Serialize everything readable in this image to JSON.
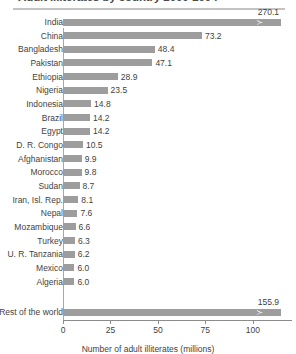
{
  "chart_data": {
    "type": "bar",
    "orientation": "horizontal",
    "title": "Adult illiterates by country 2000-2004",
    "xlabel": "Number of adult illiterates (millions)",
    "ylabel": "",
    "xlim": [
      0,
      115
    ],
    "xticks": [
      0,
      25,
      50,
      75,
      100
    ],
    "xtick_labels": [
      "0",
      "25",
      "50",
      "75",
      "100"
    ],
    "grid": false,
    "legend": null,
    "bar_color": "#9d9d9d",
    "axis_break_note": "Bars for India and Rest of the world are truncated with an axis-break marker",
    "categories": [
      "India",
      "China",
      "Bangladesh",
      "Pakistan",
      "Ethiopia",
      "Nigeria",
      "Indonesia",
      "Brazil",
      "Egypt",
      "D. R. Congo",
      "Afghanistan",
      "Morocco",
      "Sudan",
      "Iran, Isl. Rep.",
      "Nepal",
      "Mozambique",
      "Turkey",
      "U. R. Tanzania",
      "Mexico",
      "Algeria",
      "Rest of the world"
    ],
    "values": [
      270.1,
      73.2,
      48.4,
      47.1,
      28.9,
      23.5,
      14.8,
      14.2,
      14.2,
      10.5,
      9.9,
      9.8,
      8.7,
      8.1,
      7.6,
      6.6,
      6.3,
      6.2,
      6.0,
      6.0,
      155.9
    ],
    "value_labels": [
      "270.1",
      "73.2",
      "48.4",
      "47.1",
      "28.9",
      "23.5",
      "14.8",
      "14.2",
      "14.2",
      "10.5",
      "9.9",
      "9.8",
      "8.7",
      "8.1",
      "7.6",
      "6.6",
      "6.3",
      "6.2",
      "6.0",
      "6.0",
      "155.9"
    ],
    "truncated": [
      true,
      false,
      false,
      false,
      false,
      false,
      false,
      false,
      false,
      false,
      false,
      false,
      false,
      false,
      false,
      false,
      false,
      false,
      false,
      false,
      true
    ]
  }
}
